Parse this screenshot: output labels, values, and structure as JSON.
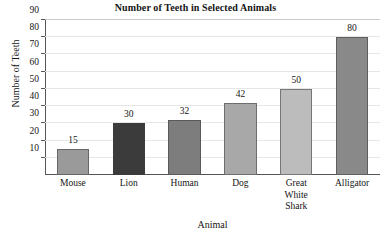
{
  "chart_data": {
    "type": "bar",
    "title": "Number of Teeth in Selected Animals",
    "xlabel": "Animal",
    "ylabel": "Number of Teeth",
    "categories": [
      "Mouse",
      "Lion",
      "Human",
      "Dog",
      "Great White Shark",
      "Alligator"
    ],
    "category_lines": [
      [
        "Mouse"
      ],
      [
        "Lion"
      ],
      [
        "Human"
      ],
      [
        "Dog"
      ],
      [
        "Great",
        "White",
        "Shark"
      ],
      [
        "Alligator"
      ]
    ],
    "values": [
      15,
      30,
      32,
      42,
      50,
      80
    ],
    "bar_colors": [
      "#9a9a9a",
      "#3b3b3b",
      "#7d7d7d",
      "#a8a8a8",
      "#bcbcbc",
      "#898989"
    ],
    "ylim": [
      0,
      90
    ],
    "yticks": [
      10,
      20,
      30,
      40,
      50,
      60,
      70,
      80,
      90
    ],
    "ytick_labels": [
      "10",
      "20",
      "30",
      "40",
      "50",
      "60",
      "70",
      "80",
      "90"
    ],
    "value_labels": [
      "15",
      "30",
      "32",
      "42",
      "50",
      "80"
    ],
    "grid": "horizontal",
    "legend": "none"
  },
  "colors": {
    "background": "#ffffff",
    "axis": "#555555",
    "gridline": "#e6e6e6",
    "text": "#141414"
  }
}
